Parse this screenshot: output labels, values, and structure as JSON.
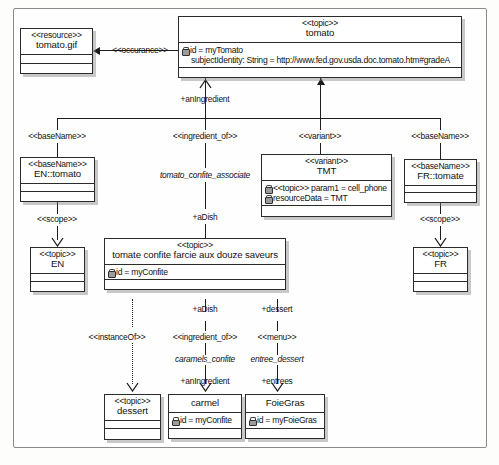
{
  "diagram": {
    "nodes": {
      "resource_tomato_gif": {
        "stereotype": "<<resource>>",
        "name": "tomato.gif"
      },
      "topic_tomato": {
        "stereotype": "<<topic>>",
        "name": "tomato",
        "attr1": "id = myTomato",
        "attr2": "subjectIdentity: String = http://www.fed.gov.usda.doc.tomato.htm#gradeA"
      },
      "basename_en": {
        "stereotype": "<<baseName>>",
        "name": "EN::tomato"
      },
      "topic_en": {
        "stereotype": "<<topic>>",
        "name": "EN"
      },
      "variant_tmt": {
        "stereotype": "<<variant>>",
        "name": "TMT",
        "attr1": "<<topic>> param1 = cell_phone",
        "attr2": "resourceData = TMT"
      },
      "basename_fr": {
        "stereotype": "<<baseName>>",
        "name": "FR::tomate"
      },
      "topic_fr": {
        "stereotype": "<<topic>>",
        "name": "FR"
      },
      "topic_confite": {
        "stereotype": "<<topic>>",
        "name": "tomate confite farcie aux douze saveurs",
        "attr1": "id = myConfite"
      },
      "topic_dessert": {
        "stereotype": "<<topic>>",
        "name": "dessert"
      },
      "topic_carmel": {
        "name": "carmel",
        "attr1": "id = myConfite"
      },
      "topic_foiegras": {
        "name": "FoieGras",
        "attr1": "id = myFoieGras"
      }
    },
    "labels": {
      "occurance": "<<occurance>>",
      "anIngredient_top": "+anIngredient",
      "basename_left_stereo": "<<baseName>>",
      "ingredient_of_top": "<<ingredient_of>>",
      "variant_stereo": "<<variant>>",
      "basename_right_stereo": "<<baseName>>",
      "scope_left": "<<scope>>",
      "scope_right": "<<scope>>",
      "tomato_confite_associate": "tomato_confite_associate",
      "aDish_top": "+aDish",
      "aDish_bottom": "+aDish",
      "dessert_role": "+dessert",
      "instanceOf": "<<instanceOf>>",
      "ingredient_of_bottom": "<<ingredient_of>>",
      "menu": "<<menu>>",
      "caramels_confite": "caramels_confite",
      "entree_dessert": "entree_dessert",
      "anIngredient_bottom": "+anIngredient",
      "entrees": "+entrees"
    }
  }
}
